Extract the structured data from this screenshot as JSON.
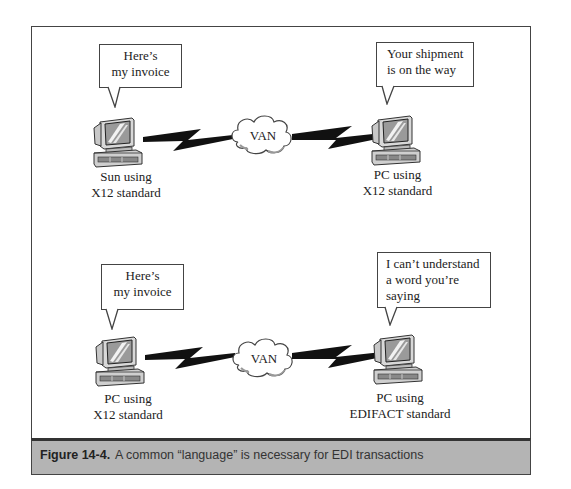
{
  "figure": {
    "number_label": "Figure 14-4.",
    "caption": "A common “language” is necessary for EDI transactions"
  },
  "scenarios": [
    {
      "left": {
        "bubble": [
          "Here’s",
          "my invoice"
        ],
        "label": [
          "Sun using",
          "X12 standard"
        ]
      },
      "network": "VAN",
      "right": {
        "bubble": [
          "Your shipment",
          "is on the way"
        ],
        "label": [
          "PC using",
          "X12 standard"
        ]
      }
    },
    {
      "left": {
        "bubble": [
          "Here’s",
          "my invoice"
        ],
        "label": [
          "PC using",
          "X12 standard"
        ]
      },
      "network": "VAN",
      "right": {
        "bubble": [
          "I can’t understand",
          "a word you’re",
          "saying"
        ],
        "label": [
          "PC using",
          "EDIFACT standard"
        ]
      }
    }
  ],
  "icons": {
    "computer": "computer-icon",
    "cloud": "cloud-icon",
    "link": "lightning-bolt-icon"
  },
  "colors": {
    "caption_bar": "#b4b4b4",
    "border": "#444444",
    "screen": "#9a9a9a",
    "bolt": "#111111"
  }
}
